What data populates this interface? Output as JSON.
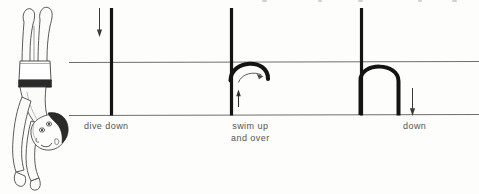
{
  "figure": {
    "kind": "instructional-line-diagram",
    "background_color": "#fdfdfc",
    "ink_color": "#1a1a1a",
    "line_color": "#6f6f6f",
    "text_color": "#3b3b3b",
    "width": 479,
    "height": 194
  },
  "illustration": {
    "name": "upside-down-diver",
    "description": "Line drawing of a child diving head-down, feet up, wearing swim trunks",
    "alt": "diver upside down"
  },
  "pool": {
    "surface_line_label": "water surface",
    "bottom_line_label": "pool bottom",
    "surface_y": 62,
    "bottom_y": 115
  },
  "panels": [
    {
      "id": "panel-1",
      "caption": "dive down",
      "bar_x": 111,
      "arrow": {
        "name": "down-arrow",
        "direction": "down",
        "x": 99,
        "y1": 8,
        "y2": 36
      },
      "path": "straight-vertical"
    },
    {
      "id": "panel-2",
      "caption": "swim up\nand over",
      "bar_x": 231,
      "arrow": {
        "name": "up-arrow",
        "direction": "up",
        "x": 238,
        "y1": 105,
        "y2": 90
      },
      "rotation_arrow": {
        "name": "curved-rotation-arrow",
        "direction": "clockwise"
      },
      "path": "small-arc-over"
    },
    {
      "id": "panel-3",
      "caption": "down",
      "bar_x": 361,
      "arrow": {
        "name": "down-arrow",
        "direction": "down",
        "x": 412,
        "y1": 90,
        "y2": 116
      },
      "path": "tall-arch-down"
    }
  ]
}
